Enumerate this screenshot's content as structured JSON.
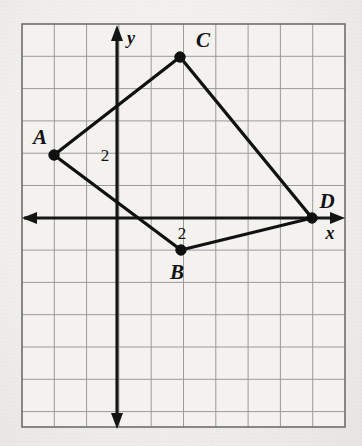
{
  "figure": {
    "background_color": "#f1efec",
    "grid": {
      "line_color": "#9a9a96",
      "border_color": "#6d6d69",
      "left_px": 22,
      "top_px": 24,
      "right_px": 345,
      "bottom_px": 427,
      "cell_px": 32.3,
      "columns": 10,
      "rows": 12
    },
    "axes": {
      "color": "#151515",
      "origin_px": {
        "x": 117,
        "y": 218
      },
      "x_label": "x",
      "y_label": "y",
      "x_label_pos": {
        "x": 330,
        "y": 239
      },
      "y_label_pos": {
        "x": 131,
        "y": 44
      }
    },
    "tick_labels": [
      {
        "text": "2",
        "x": 105,
        "y": 161,
        "name": "y-axis-tick-2"
      },
      {
        "text": "2",
        "x": 182,
        "y": 239,
        "name": "x-axis-tick-2"
      }
    ]
  },
  "chart_data": {
    "type": "scatter",
    "xlabel": "x",
    "ylabel": "y",
    "grid": true,
    "legend": "none",
    "unit_px": 32.3,
    "origin_px": {
      "x": 117,
      "y": 218
    },
    "xlim": [
      -3,
      7
    ],
    "ylim": [
      -6.5,
      6
    ],
    "points": [
      {
        "label": "A",
        "x": -2,
        "y": 2,
        "px": 54,
        "py": 155,
        "label_px": {
          "x": 40,
          "y": 144
        }
      },
      {
        "label": "B",
        "x": 2,
        "y": -1,
        "px": 181,
        "py": 250,
        "label_px": {
          "x": 177,
          "y": 279
        }
      },
      {
        "label": "C",
        "x": 2,
        "y": 5,
        "px": 180,
        "py": 57,
        "label_px": {
          "x": 203,
          "y": 47
        }
      },
      {
        "label": "D",
        "x": 6,
        "y": 0,
        "px": 312,
        "py": 218,
        "label_px": {
          "x": 327,
          "y": 208
        }
      }
    ],
    "edges": [
      {
        "from": "A",
        "to": "C"
      },
      {
        "from": "C",
        "to": "D"
      },
      {
        "from": "D",
        "to": "B"
      },
      {
        "from": "B",
        "to": "A"
      }
    ]
  }
}
